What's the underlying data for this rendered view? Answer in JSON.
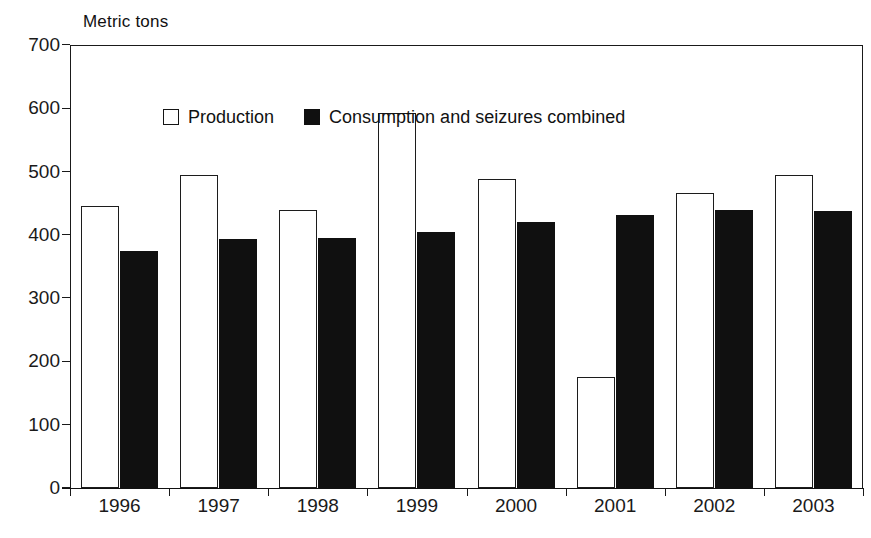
{
  "chart_data": {
    "type": "bar",
    "title": "",
    "ylabel": "Metric tons",
    "xlabel": "",
    "ylim": [
      0,
      700
    ],
    "yticks": [
      0,
      100,
      200,
      300,
      400,
      500,
      600,
      700
    ],
    "ytick_labels": [
      "0",
      "100",
      "200",
      "300",
      "400",
      "500",
      "600",
      "700"
    ],
    "grid": false,
    "legend_position": "top-left-inside",
    "categories": [
      "1996",
      "1997",
      "1998",
      "1999",
      "2000",
      "2001",
      "2002",
      "2003"
    ],
    "series": [
      {
        "name": "Production",
        "color": "#ffffff",
        "edge_color": "#1c1c1c",
        "values": [
          445,
          494,
          439,
          592,
          488,
          175,
          466,
          495
        ]
      },
      {
        "name": "Consumption and seizures combined",
        "color": "#101010",
        "edge_color": "#101010",
        "values": [
          375,
          393,
          395,
          405,
          421,
          432,
          440,
          437
        ]
      }
    ]
  },
  "legend": {
    "items": [
      {
        "label": "Production",
        "swatch": "hollow-square"
      },
      {
        "label": "Consumption and seizures combined",
        "swatch": "filled-square"
      }
    ]
  },
  "colors": {
    "axis": "#1a1a1a",
    "background": "#ffffff",
    "production": "#ffffff",
    "consumption": "#101010"
  }
}
